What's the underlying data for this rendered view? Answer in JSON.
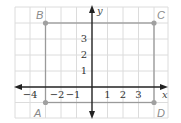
{
  "figure": {
    "type": "coordinate-plane",
    "axes": {
      "x_label": "x",
      "y_label": "y"
    },
    "x_tick_labels": [
      {
        "value": -4,
        "text": "−4"
      },
      {
        "value": -2,
        "text": "−2"
      },
      {
        "value": -1,
        "text": "−1"
      },
      {
        "value": 1,
        "text": "1"
      },
      {
        "value": 2,
        "text": "2"
      },
      {
        "value": 3,
        "text": "3"
      }
    ],
    "y_tick_labels": [
      {
        "value": 1,
        "text": "1"
      },
      {
        "value": 2,
        "text": "2"
      },
      {
        "value": 3,
        "text": "3"
      }
    ],
    "points": [
      {
        "name": "A",
        "x": -3,
        "y": -1
      },
      {
        "name": "B",
        "x": -3,
        "y": 4
      },
      {
        "name": "C",
        "x": 4,
        "y": 4
      },
      {
        "name": "D",
        "x": 4,
        "y": -1
      }
    ],
    "polygon": [
      "A",
      "B",
      "C",
      "D"
    ],
    "grid": {
      "x_range": [
        -5,
        5
      ],
      "y_range": [
        -2,
        5
      ]
    },
    "colors": {
      "grid": "#dcdcdc",
      "axis": "#222222",
      "shape": "#9a9a9a",
      "point": "#a0a0a0"
    }
  }
}
